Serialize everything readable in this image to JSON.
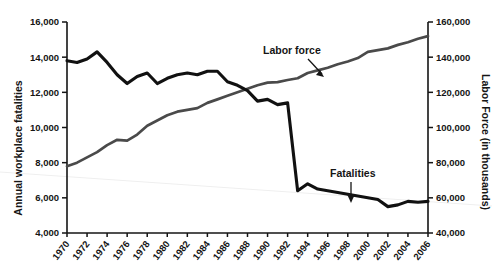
{
  "chart_data": {
    "type": "line",
    "title": "",
    "xlabel": "",
    "x": [
      1970,
      1971,
      1972,
      1973,
      1974,
      1975,
      1976,
      1977,
      1978,
      1979,
      1980,
      1981,
      1982,
      1983,
      1984,
      1985,
      1986,
      1987,
      1988,
      1989,
      1990,
      1991,
      1992,
      1993,
      1994,
      1995,
      1996,
      1997,
      1998,
      1999,
      2000,
      2001,
      2002,
      2003,
      2004,
      2005,
      2006
    ],
    "xtick_labels": [
      "1970",
      "1972",
      "1974",
      "1976",
      "1978",
      "1980",
      "1982",
      "1984",
      "1986",
      "1988",
      "1990",
      "1992",
      "1994",
      "1996",
      "1998",
      "2000",
      "2002",
      "2004",
      "2006"
    ],
    "xlim": [
      1970,
      2006
    ],
    "grid": false,
    "legend_position": "inline-annotations",
    "series": [
      {
        "name": "Fatalities",
        "axis": "left",
        "color": "#111111",
        "ylabel": "Annual workplace fatalities",
        "ylim": [
          4000,
          16000
        ],
        "ytick_labels": [
          "4,000",
          "6,000",
          "8,000",
          "10,000",
          "12,000",
          "14,000",
          "16,000"
        ],
        "ytick_values": [
          4000,
          6000,
          8000,
          10000,
          12000,
          14000,
          16000
        ],
        "values": [
          13800,
          13700,
          13900,
          14300,
          13700,
          13000,
          12500,
          12900,
          13100,
          12500,
          12800,
          13000,
          13100,
          13000,
          13200,
          13200,
          12600,
          12400,
          12100,
          11500,
          11600,
          11300,
          11400,
          6400,
          6800,
          6500,
          6400,
          6300,
          6200,
          6100,
          6000,
          5900,
          5500,
          5600,
          5800,
          5750,
          5800
        ]
      },
      {
        "name": "Labor force",
        "axis": "right",
        "color": "#4a4a4a",
        "ylabel": "Labor Force (in thousands)",
        "ylim": [
          40000,
          160000
        ],
        "ytick_labels": [
          "40,000",
          "60,000",
          "80,000",
          "100,000",
          "120,000",
          "140,000",
          "160,000"
        ],
        "ytick_values": [
          40000,
          60000,
          80000,
          100000,
          120000,
          140000,
          160000
        ],
        "values": [
          78000,
          80000,
          83000,
          86000,
          90000,
          93000,
          92500,
          96000,
          101000,
          104000,
          107000,
          109000,
          110000,
          111000,
          114000,
          116000,
          118000,
          120000,
          122000,
          124000,
          125500,
          125800,
          127000,
          128000,
          131000,
          132500,
          134000,
          136000,
          137500,
          139500,
          143000,
          144000,
          145000,
          147000,
          148500,
          150500,
          152000
        ]
      }
    ],
    "annotations": [
      {
        "text": "Labor force",
        "target_series": "Labor force",
        "arrow": "diagonal-down-right"
      },
      {
        "text": "Fatalities",
        "target_series": "Fatalities",
        "arrow": "vertical-down"
      }
    ]
  },
  "axes": {
    "left": {
      "title": "Annual workplace fatalities",
      "ticks": [
        "16,000",
        "14,000",
        "12,000",
        "10,000",
        "8,000",
        "6,000",
        "4,000"
      ]
    },
    "right": {
      "title": "Labor Force (in thousands)",
      "ticks": [
        "160,000",
        "140,000",
        "120,000",
        "100,000",
        "80,000",
        "60,000",
        "40,000"
      ]
    },
    "bottom": {
      "ticks": [
        "1970",
        "1972",
        "1974",
        "1976",
        "1978",
        "1980",
        "1982",
        "1984",
        "1986",
        "1988",
        "1990",
        "1992",
        "1994",
        "1996",
        "1998",
        "2000",
        "2002",
        "2004",
        "2006"
      ]
    }
  },
  "annotations": {
    "labor_force": "Labor force",
    "fatalities": "Fatalities"
  }
}
